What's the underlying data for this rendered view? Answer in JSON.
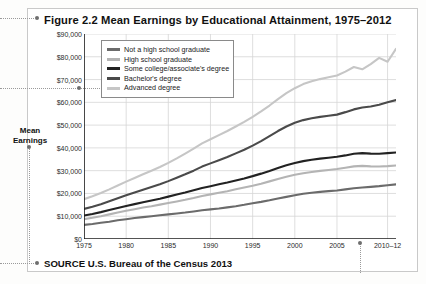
{
  "figure": {
    "title": "Figure 2.2  Mean Earnings by Educational Attainment, 1975–2012",
    "source": "SOURCE  U.S. Bureau of the Census 2013",
    "ylabel_line1": "Mean",
    "ylabel_line2": "Earnings"
  },
  "colors": {
    "not_hs": "#6b6b6b",
    "hs": "#b4b4b4",
    "some_college": "#222222",
    "bachelors": "#4a4a4a",
    "advanced": "#c6c6c6",
    "grid": "#d6d6d6",
    "axis": "#1a1a1a",
    "frame": "#c9c9c9"
  },
  "chart_data": {
    "type": "line",
    "title": "Figure 2.2  Mean Earnings by Educational Attainment, 1975–2012",
    "xlabel": "",
    "ylabel": "Mean Earnings",
    "grid": true,
    "legend_position": "top-left-inside",
    "xlim": [
      1975,
      2012
    ],
    "ylim": [
      0,
      90000
    ],
    "ytick_labels": [
      "$90,000",
      "$80,000",
      "$70,000",
      "$60,000",
      "$50,000",
      "$40,000",
      "$30,000",
      "$20,000",
      "$10,000",
      "$0"
    ],
    "ytick_values": [
      90000,
      80000,
      70000,
      60000,
      50000,
      40000,
      30000,
      20000,
      10000,
      0
    ],
    "xtick_labels": [
      "1975",
      "1980",
      "1985",
      "1990",
      "1995",
      "2000",
      "2005",
      "2010–12"
    ],
    "xtick_values": [
      1975,
      1980,
      1985,
      1990,
      1995,
      2000,
      2005,
      2011
    ],
    "x": [
      1975,
      1976,
      1977,
      1978,
      1979,
      1980,
      1981,
      1982,
      1983,
      1984,
      1985,
      1986,
      1987,
      1988,
      1989,
      1990,
      1991,
      1992,
      1993,
      1994,
      1995,
      1996,
      1997,
      1998,
      1999,
      2000,
      2001,
      2002,
      2003,
      2004,
      2005,
      2006,
      2007,
      2008,
      2009,
      2010,
      2011,
      2012
    ],
    "series": [
      {
        "name": "Not a high school graduate",
        "color": "#6b6b6b",
        "values": [
          6200,
          6600,
          7100,
          7600,
          8200,
          8700,
          9200,
          9600,
          10000,
          10400,
          10800,
          11200,
          11600,
          12100,
          12600,
          13000,
          13400,
          13900,
          14400,
          15000,
          15700,
          16300,
          17000,
          17800,
          18500,
          19200,
          19900,
          20300,
          20700,
          21000,
          21300,
          21800,
          22300,
          22600,
          22900,
          23200,
          23600,
          24000
        ]
      },
      {
        "name": "High school graduate",
        "color": "#b4b4b4",
        "values": [
          8700,
          9300,
          10000,
          10800,
          11600,
          12400,
          13100,
          13800,
          14400,
          15100,
          15800,
          16500,
          17200,
          18000,
          18900,
          19600,
          20300,
          21000,
          21800,
          22600,
          23400,
          24300,
          25300,
          26300,
          27300,
          28200,
          28900,
          29400,
          29900,
          30300,
          30700,
          31300,
          31900,
          32100,
          31900,
          31800,
          32000,
          32300
        ]
      },
      {
        "name": "Some college/associate's degree",
        "color": "#222222",
        "values": [
          10300,
          11000,
          11800,
          12700,
          13600,
          14500,
          15300,
          16100,
          16900,
          17700,
          18600,
          19500,
          20400,
          21400,
          22400,
          23200,
          24000,
          24800,
          25700,
          26600,
          27600,
          28700,
          29900,
          31200,
          32400,
          33400,
          34200,
          34800,
          35300,
          35700,
          36100,
          36700,
          37400,
          37700,
          37500,
          37400,
          37700,
          38000
        ]
      },
      {
        "name": "Bachelor's degree",
        "color": "#4a4a4a",
        "values": [
          13200,
          14200,
          15300,
          16600,
          17900,
          19200,
          20400,
          21600,
          22800,
          24000,
          25400,
          26900,
          28400,
          30000,
          31800,
          33200,
          34600,
          36000,
          37600,
          39200,
          41000,
          43000,
          45200,
          47400,
          49400,
          51000,
          52200,
          53000,
          53600,
          54100,
          54600,
          55700,
          56900,
          57700,
          58200,
          58900,
          60000,
          61000
        ]
      },
      {
        "name": "Advanced degree",
        "color": "#c6c6c6",
        "values": [
          17500,
          18800,
          20200,
          21800,
          23500,
          25200,
          26800,
          28400,
          30000,
          31600,
          33400,
          35400,
          37500,
          39700,
          42000,
          43800,
          45600,
          47400,
          49400,
          51400,
          53600,
          56000,
          58600,
          61400,
          64000,
          66200,
          68000,
          69300,
          70200,
          71000,
          71800,
          73500,
          75500,
          74500,
          76800,
          79500,
          77800,
          83500
        ]
      }
    ]
  },
  "legend": {
    "items": [
      {
        "label": "Not a high school graduate",
        "color": "#6b6b6b"
      },
      {
        "label": "High school graduate",
        "color": "#b4b4b4"
      },
      {
        "label": "Some college/associate's degree",
        "color": "#222222"
      },
      {
        "label": "Bachelor's degree",
        "color": "#4a4a4a"
      },
      {
        "label": "Advanced degree",
        "color": "#c6c6c6"
      }
    ]
  }
}
